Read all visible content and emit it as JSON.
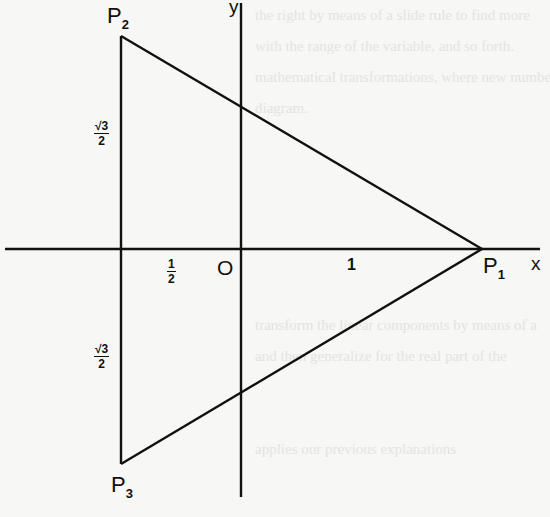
{
  "figure": {
    "type": "coordinate-diagram",
    "axes": {
      "x_label": "x",
      "y_label": "y",
      "origin_label": "O"
    },
    "points": [
      {
        "id": "P1",
        "label": "P",
        "sub": "1",
        "coords": [
          1,
          0
        ]
      },
      {
        "id": "P2",
        "label": "P",
        "sub": "2",
        "coords": [
          -0.5,
          0.866
        ]
      },
      {
        "id": "P3",
        "label": "P",
        "sub": "3",
        "coords": [
          -0.5,
          -0.866
        ]
      }
    ],
    "annotations": {
      "half": {
        "num": "1",
        "den": "2"
      },
      "one": "1",
      "sqrt3_over_2_upper": {
        "num": "√3",
        "den": "2"
      },
      "sqrt3_over_2_lower": {
        "num": "√3",
        "den": "2"
      }
    },
    "colors": {
      "ink": "#111111",
      "paper": "#f7f7f5",
      "bleed_text": "#e4e4e1"
    }
  },
  "background_bleed": [
    "the right by means of a slide rule to find more",
    "with the range of the variable, and so forth.",
    "",
    "mathematical transformations, where new numbers are",
    "diagram.",
    "",
    "",
    "",
    "",
    "",
    "",
    "",
    "",
    "transform the linear components by means of a",
    "and then generalize for the real part of the",
    "",
    "",
    "",
    "applies our previous explanations"
  ]
}
